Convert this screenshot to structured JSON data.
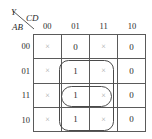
{
  "diagram": {
    "type": "karnaugh-map",
    "function_label": "Y",
    "column_variable": "CD",
    "row_variable": "AB",
    "column_headers": [
      "00",
      "01",
      "11",
      "10"
    ],
    "row_headers": [
      "00",
      "01",
      "11",
      "10"
    ],
    "cells": [
      [
        "×",
        "0",
        "×",
        "0"
      ],
      [
        "×",
        "1",
        "×",
        "0"
      ],
      [
        "×",
        "1",
        "×",
        "0"
      ],
      [
        "×",
        "1",
        "×",
        "0"
      ]
    ],
    "groups": [
      {
        "name": "outer-group",
        "shape": "rounded-rectangle",
        "rows": [
          "01",
          "11",
          "10"
        ],
        "columns": [
          "01",
          "11"
        ]
      },
      {
        "name": "inner-group",
        "shape": "pill",
        "rows": [
          "11"
        ],
        "columns": [
          "01",
          "11"
        ]
      }
    ],
    "colors": {
      "grid_line": "#5a5a5a",
      "text": "#2b2b2b",
      "dont_care": "#a8a8a8",
      "group_outline": "#4a4a4a"
    }
  }
}
